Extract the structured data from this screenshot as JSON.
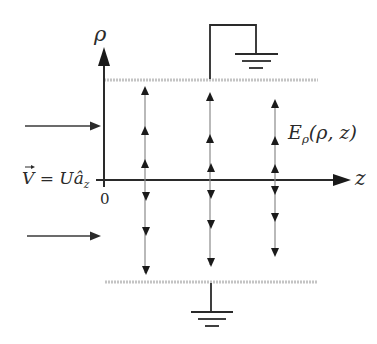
{
  "figure": {
    "labels": {
      "rho_axis": "ρ",
      "z_axis": "z",
      "origin": "0",
      "field_label_main": "E",
      "field_label_sub": "ρ",
      "field_label_args": "(ρ, z)",
      "velocity_V": "V",
      "velocity_eq": " = U",
      "velocity_unit": "â",
      "velocity_unit_sub": "z"
    },
    "colors": {
      "ink": "#2a2a2a",
      "plate": "#bdbdbd",
      "field_line": "#8a8a8a"
    },
    "elements": {
      "top_plate": "grounded electrode (top)",
      "bottom_plate": "grounded electrode (bottom)",
      "flow_arrows": 2,
      "field_columns": 3
    }
  }
}
